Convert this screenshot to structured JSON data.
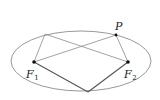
{
  "diagram": {
    "title": "",
    "ellipse": {
      "cx": 81,
      "cy": 61,
      "rx": 70,
      "ry": 30,
      "stroke": "#8c8c8c"
    },
    "points": {
      "F1": {
        "x": 34,
        "y": 62,
        "label": "F",
        "sub": "1"
      },
      "F2": {
        "x": 128,
        "y": 62,
        "label": "F",
        "sub": "2"
      },
      "P": {
        "x": 116,
        "y": 35,
        "label": "P"
      },
      "Q": {
        "x": 45,
        "y": 34
      },
      "B": {
        "x": 88,
        "y": 92
      }
    },
    "colors": {
      "thin_line": "#8c8c8c",
      "thick_line": "#555555",
      "point": "#111111",
      "text": "#222222"
    }
  }
}
